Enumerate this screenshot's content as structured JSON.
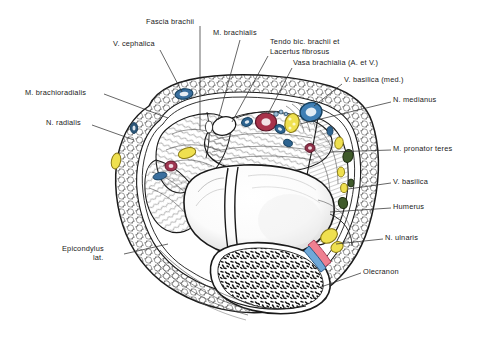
{
  "figure": {
    "kind": "anatomical-cross-section",
    "region": "Right elbow, transverse section through cubital fossa",
    "background_color": "#ffffff",
    "ink_color": "#1a1a1a"
  },
  "labels": [
    {
      "id": "fascia-brachii",
      "text": "Fascia brachii",
      "x": 146,
      "y": 22,
      "align": "left"
    },
    {
      "id": "m-brachialis",
      "text": "M. brachialis",
      "x": 213,
      "y": 33,
      "align": "left"
    },
    {
      "id": "v-cephalica",
      "text": "V. cephalica",
      "x": 113,
      "y": 44,
      "align": "left"
    },
    {
      "id": "tendo-bic-brachii",
      "text": "Tendo bic. brachii et",
      "x": 270,
      "y": 42,
      "align": "left"
    },
    {
      "id": "lacertus-fibrosus",
      "text": "Lacertus fibrosus",
      "x": 270,
      "y": 52,
      "align": "left"
    },
    {
      "id": "vasa-brachialia",
      "text": "Vasa brachialia (A. et V.)",
      "x": 293,
      "y": 63,
      "align": "left"
    },
    {
      "id": "v-basilica-med",
      "text": "V. basilica (med.)",
      "x": 344,
      "y": 80,
      "align": "left"
    },
    {
      "id": "m-brachioradialis",
      "text": "M. brachioradialis",
      "x": 25,
      "y": 93,
      "align": "left"
    },
    {
      "id": "n-medianus",
      "text": "N. medianus",
      "x": 393,
      "y": 100,
      "align": "left"
    },
    {
      "id": "n-radialis",
      "text": "N. radialis",
      "x": 46,
      "y": 123,
      "align": "left"
    },
    {
      "id": "m-pronator-teres",
      "text": "M. pronator teres",
      "x": 393,
      "y": 149,
      "align": "left"
    },
    {
      "id": "v-basilica",
      "text": "V. basilica",
      "x": 393,
      "y": 182,
      "align": "left"
    },
    {
      "id": "humerus",
      "text": "Humerus",
      "x": 393,
      "y": 207,
      "align": "left"
    },
    {
      "id": "n-ulnaris",
      "text": "N. ulnaris",
      "x": 385,
      "y": 238,
      "align": "left"
    },
    {
      "id": "epicondylus-lat-1",
      "text": "Epicondylus",
      "x": 62,
      "y": 249,
      "align": "left"
    },
    {
      "id": "epicondylus-lat-2",
      "text": "lat.",
      "x": 93,
      "y": 258,
      "align": "left"
    },
    {
      "id": "olecranon",
      "text": "Olecranon",
      "x": 363,
      "y": 272,
      "align": "left"
    }
  ],
  "structures": [
    {
      "id": "v-cephalica-vessel",
      "name": "V. cephalica",
      "type": "vein",
      "color": "#3a6f9e"
    },
    {
      "id": "v-basilica-vessel",
      "name": "V. basilica",
      "type": "vein",
      "color": "#3f7fb5"
    },
    {
      "id": "a-brachialis-vessel",
      "name": "A. brachialis",
      "type": "artery",
      "color": "#a8324a"
    },
    {
      "id": "n-medianus-nerve",
      "name": "N. medianus",
      "type": "nerve",
      "color": "#e8d84a"
    },
    {
      "id": "n-radialis-nerve",
      "name": "N. radialis",
      "type": "nerve",
      "color": "#e8d84a"
    },
    {
      "id": "n-ulnaris-nerve",
      "name": "N. ulnaris",
      "type": "nerve",
      "color": "#efe04f"
    },
    {
      "id": "a-collateralis",
      "name": "A. collateralis",
      "type": "artery",
      "color": "#ef8090"
    },
    {
      "id": "v-collateralis",
      "name": "V. collateralis",
      "type": "vein",
      "color": "#6fa8d8"
    },
    {
      "id": "lymph-nodes",
      "name": "Nodi lymphoidei",
      "type": "lymph-node",
      "color": "#3f5a2a"
    },
    {
      "id": "humerus-bone",
      "name": "Humerus",
      "type": "bone",
      "color": "#ffffff"
    },
    {
      "id": "olecranon-bone",
      "name": "Olecranon",
      "type": "bone",
      "color": "#ffffff"
    },
    {
      "id": "subcutaneous-fat",
      "name": "Panniculus adiposus",
      "type": "fat",
      "color": "#ffffff"
    }
  ]
}
